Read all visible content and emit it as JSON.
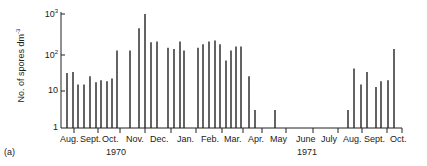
{
  "panel_label": "(a)",
  "chart_data": {
    "type": "bar",
    "title": "",
    "xlabel": "",
    "ylabel": "No. of spores dm^-3",
    "yscale": "log",
    "ylim": [
      1,
      1000
    ],
    "yticks": [
      "1",
      "10",
      "10^2",
      "10^3"
    ],
    "grid": false,
    "x_month_labels": [
      "Aug.",
      "Sept.",
      "Oct.",
      "Nov.",
      "Dec.",
      "Jan.",
      "Feb.",
      "Mar.",
      "Apr.",
      "May",
      "June",
      "July",
      "Aug.",
      "Sept.",
      "Oct."
    ],
    "year_labels": [
      "1970",
      "1971"
    ],
    "bars": [
      {
        "x": 67,
        "value": 28
      },
      {
        "x": 73,
        "value": 30
      },
      {
        "x": 78,
        "value": 14
      },
      {
        "x": 84,
        "value": 14
      },
      {
        "x": 90,
        "value": 23
      },
      {
        "x": 96,
        "value": 16
      },
      {
        "x": 101,
        "value": 18
      },
      {
        "x": 107,
        "value": 17
      },
      {
        "x": 112,
        "value": 20
      },
      {
        "x": 117,
        "value": 110
      },
      {
        "x": 130,
        "value": 110
      },
      {
        "x": 139,
        "value": 420
      },
      {
        "x": 145,
        "value": 1000
      },
      {
        "x": 151,
        "value": 180
      },
      {
        "x": 157,
        "value": 190
      },
      {
        "x": 168,
        "value": 130
      },
      {
        "x": 174,
        "value": 120
      },
      {
        "x": 180,
        "value": 190
      },
      {
        "x": 184,
        "value": 110
      },
      {
        "x": 198,
        "value": 130
      },
      {
        "x": 203,
        "value": 160
      },
      {
        "x": 209,
        "value": 190
      },
      {
        "x": 215,
        "value": 200
      },
      {
        "x": 220,
        "value": 160
      },
      {
        "x": 226,
        "value": 60
      },
      {
        "x": 231,
        "value": 110
      },
      {
        "x": 236,
        "value": 140
      },
      {
        "x": 241,
        "value": 140
      },
      {
        "x": 249,
        "value": 23
      },
      {
        "x": 255,
        "value": 3
      },
      {
        "x": 275,
        "value": 3
      },
      {
        "x": 348,
        "value": 3
      },
      {
        "x": 354,
        "value": 37
      },
      {
        "x": 361,
        "value": 14
      },
      {
        "x": 367,
        "value": 30
      },
      {
        "x": 376,
        "value": 12
      },
      {
        "x": 381,
        "value": 17
      },
      {
        "x": 388,
        "value": 18
      },
      {
        "x": 394,
        "value": 120
      }
    ]
  }
}
